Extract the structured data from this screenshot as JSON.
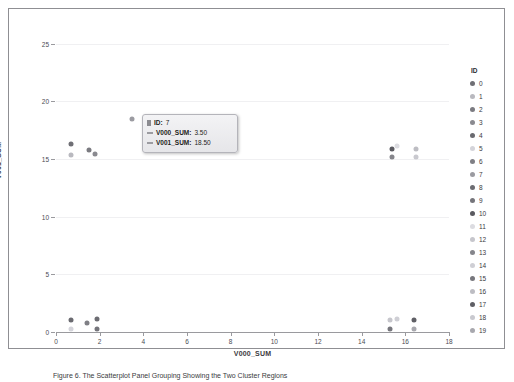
{
  "axes": {
    "x_title": "V000_SUM",
    "y_title": "V001_SUM",
    "x_ticks": [
      "0",
      "2",
      "4",
      "6",
      "8",
      "10",
      "12",
      "14",
      "16",
      "18"
    ],
    "y_ticks": [
      "0",
      "5",
      "10",
      "15",
      "20",
      "25"
    ]
  },
  "tooltip": {
    "id_key": "ID:",
    "id_value": "7",
    "v000_key": "V000_SUM:",
    "v000_value": "3.50",
    "v001_key": "V001_SUM:",
    "v001_value": "18.50"
  },
  "legend": {
    "title": "ID",
    "items": [
      {
        "label": "0",
        "color": "#6f6f75"
      },
      {
        "label": "1",
        "color": "#b9b9bf"
      },
      {
        "label": "2",
        "color": "#7b7b81"
      },
      {
        "label": "3",
        "color": "#8a8a90"
      },
      {
        "label": "4",
        "color": "#6a6a70"
      },
      {
        "label": "5",
        "color": "#d4d4da"
      },
      {
        "label": "6",
        "color": "#7f7f85"
      },
      {
        "label": "7",
        "color": "#9b9ba1"
      },
      {
        "label": "8",
        "color": "#6c6c72"
      },
      {
        "label": "9",
        "color": "#75757b"
      },
      {
        "label": "10",
        "color": "#5a5a60"
      },
      {
        "label": "11",
        "color": "#dcdce1"
      },
      {
        "label": "12",
        "color": "#c6c6cc"
      },
      {
        "label": "13",
        "color": "#85858b"
      },
      {
        "label": "14",
        "color": "#cfcfd5"
      },
      {
        "label": "15",
        "color": "#77777d"
      },
      {
        "label": "16",
        "color": "#bdbdc3"
      },
      {
        "label": "17",
        "color": "#5f5f65"
      },
      {
        "label": "18",
        "color": "#c9c9cf"
      },
      {
        "label": "19",
        "color": "#a8a8ae"
      }
    ]
  },
  "caption": "Figure 6.   The Scatterplot Panel Grouping Showing the Two Cluster Regions",
  "chart_data": {
    "type": "scatter",
    "title": "",
    "xlabel": "V000_SUM",
    "ylabel": "V001_SUM",
    "xlim": [
      0,
      18
    ],
    "ylim": [
      0,
      26
    ],
    "grid": true,
    "legend_position": "right",
    "points": [
      {
        "id": "0",
        "x": 0.7,
        "y": 16.3,
        "color": "#6f6f75"
      },
      {
        "id": "1",
        "x": 0.7,
        "y": 15.3,
        "color": "#b9b9bf"
      },
      {
        "id": "2",
        "x": 1.5,
        "y": 15.8,
        "color": "#7b7b81"
      },
      {
        "id": "3",
        "x": 1.8,
        "y": 15.4,
        "color": "#8a8a90"
      },
      {
        "id": "7",
        "x": 3.5,
        "y": 18.5,
        "color": "#9b9ba1"
      },
      {
        "id": "10",
        "x": 15.4,
        "y": 15.9,
        "color": "#5a5a60"
      },
      {
        "id": "11",
        "x": 15.6,
        "y": 16.1,
        "color": "#dcdce1"
      },
      {
        "id": "13",
        "x": 15.4,
        "y": 15.2,
        "color": "#85858b"
      },
      {
        "id": "16",
        "x": 16.5,
        "y": 15.9,
        "color": "#bdbdc3"
      },
      {
        "id": "18",
        "x": 16.5,
        "y": 15.2,
        "color": "#c9c9cf"
      },
      {
        "id": "4",
        "x": 0.7,
        "y": 1.0,
        "color": "#6a6a70"
      },
      {
        "id": "5",
        "x": 0.7,
        "y": 0.3,
        "color": "#d4d4da"
      },
      {
        "id": "6",
        "x": 1.4,
        "y": 0.8,
        "color": "#7f7f85"
      },
      {
        "id": "8",
        "x": 1.9,
        "y": 1.1,
        "color": "#6c6c72"
      },
      {
        "id": "9",
        "x": 1.9,
        "y": 0.3,
        "color": "#75757b"
      },
      {
        "id": "12",
        "x": 15.3,
        "y": 1.0,
        "color": "#c6c6cc"
      },
      {
        "id": "14",
        "x": 15.6,
        "y": 1.1,
        "color": "#cfcfd5"
      },
      {
        "id": "15",
        "x": 15.3,
        "y": 0.3,
        "color": "#77777d"
      },
      {
        "id": "17",
        "x": 16.4,
        "y": 1.0,
        "color": "#5f5f65"
      },
      {
        "id": "19",
        "x": 16.4,
        "y": 0.3,
        "color": "#a8a8ae"
      }
    ]
  }
}
